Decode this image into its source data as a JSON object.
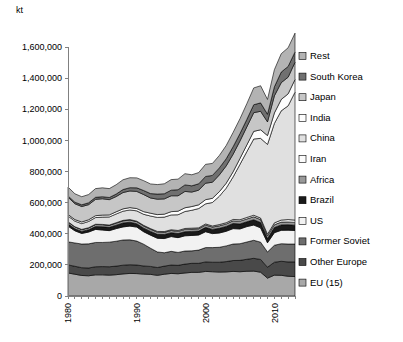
{
  "chart_data": {
    "type": "area",
    "title": "",
    "subtitle": "",
    "unit_label": "kt",
    "xlabel": "",
    "ylabel": "kt",
    "grid": false,
    "legend_position": "right",
    "stacked": true,
    "xlim": [
      1980,
      2013
    ],
    "ylim": [
      0,
      1600000
    ],
    "yticks": [
      0,
      200000,
      400000,
      600000,
      800000,
      1000000,
      1200000,
      1400000,
      1600000
    ],
    "ytick_labels": [
      "0",
      "200,000",
      "400,000",
      "600,000",
      "800,000",
      "1,000,000",
      "1,200,000",
      "1,400,000",
      "1,600,000"
    ],
    "xticks": [
      1980,
      1990,
      2000,
      2010
    ],
    "xtick_labels": [
      "1980",
      "1990",
      "2000",
      "2010"
    ],
    "x": [
      1980,
      1981,
      1982,
      1983,
      1984,
      1985,
      1986,
      1987,
      1988,
      1989,
      1990,
      1991,
      1992,
      1993,
      1994,
      1995,
      1996,
      1997,
      1998,
      1999,
      2000,
      2001,
      2002,
      2003,
      2004,
      2005,
      2006,
      2007,
      2008,
      2009,
      2010,
      2011,
      2012,
      2013
    ],
    "series": [
      {
        "name": "EU (15)",
        "color": "#a8a8a8",
        "values": [
          148000,
          140000,
          132000,
          130000,
          136000,
          136000,
          134000,
          137000,
          142000,
          145000,
          144000,
          141000,
          139000,
          133000,
          140000,
          145000,
          143000,
          148000,
          152000,
          152000,
          158000,
          156000,
          154000,
          155000,
          158000,
          156000,
          159000,
          160000,
          153000,
          115000,
          134000,
          133000,
          127000,
          125000
        ]
      },
      {
        "name": "Other Europe",
        "color": "#494949",
        "values": [
          52000,
          51000,
          50000,
          50000,
          52000,
          53000,
          54000,
          55000,
          56000,
          56000,
          55000,
          52000,
          51000,
          50000,
          52000,
          54000,
          54000,
          57000,
          58000,
          58000,
          61000,
          61000,
          63000,
          66000,
          70000,
          73000,
          77000,
          82000,
          82000,
          70000,
          83000,
          90000,
          92000,
          94000
        ]
      },
      {
        "name": "Former Soviet",
        "color": "#6e6e6e",
        "values": [
          148000,
          150000,
          152000,
          155000,
          156000,
          155000,
          158000,
          160000,
          162000,
          160000,
          154000,
          140000,
          117000,
          100000,
          86000,
          88000,
          83000,
          84000,
          80000,
          85000,
          92000,
          94000,
          96000,
          101000,
          106000,
          107000,
          111000,
          116000,
          111000,
          98000,
          109000,
          113000,
          115000,
          115000
        ]
      },
      {
        "name": "US",
        "color": "#f2f2f2",
        "values": [
          101000,
          78000,
          68000,
          76000,
          84000,
          80000,
          74000,
          81000,
          84000,
          88000,
          90000,
          80000,
          84000,
          88000,
          91000,
          95000,
          95000,
          98000,
          99000,
          97000,
          102000,
          90000,
          92000,
          94000,
          99000,
          95000,
          99000,
          98000,
          92000,
          59000,
          81000,
          86000,
          89000,
          87000
        ]
      },
      {
        "name": "Brazil",
        "color": "#1a1a1a",
        "values": [
          15000,
          13000,
          13000,
          15000,
          18000,
          21000,
          21000,
          22000,
          25000,
          25000,
          21000,
          23000,
          24000,
          25000,
          26000,
          25000,
          26000,
          26000,
          26000,
          25000,
          28000,
          27000,
          30000,
          31000,
          33000,
          32000,
          31000,
          34000,
          34000,
          27000,
          33000,
          35000,
          35000,
          34000
        ]
      },
      {
        "name": "Africa",
        "color": "#999999",
        "values": [
          12000,
          12000,
          12000,
          12000,
          13000,
          13000,
          13000,
          13000,
          14000,
          14000,
          14000,
          14000,
          14000,
          14000,
          14000,
          14000,
          14000,
          15000,
          15000,
          15000,
          15000,
          15000,
          16000,
          16000,
          17000,
          18000,
          18000,
          19000,
          19000,
          17000,
          18000,
          18000,
          18000,
          18000
        ]
      },
      {
        "name": "Iran",
        "color": "#fbfbfb",
        "values": [
          1000,
          1000,
          1000,
          1000,
          2000,
          2000,
          2000,
          3000,
          3000,
          3000,
          3000,
          4000,
          4000,
          5000,
          5000,
          5000,
          6000,
          6000,
          6000,
          6000,
          7000,
          7000,
          8000,
          8000,
          9000,
          9000,
          10000,
          10000,
          10000,
          11000,
          12000,
          13000,
          15000,
          15000
        ]
      },
      {
        "name": "China",
        "color": "#e0e0e0",
        "values": [
          37000,
          36000,
          37000,
          40000,
          43000,
          47000,
          52000,
          56000,
          59000,
          62000,
          66000,
          71000,
          81000,
          90000,
          93000,
          95000,
          101000,
          109000,
          115000,
          124000,
          129000,
          151000,
          182000,
          222000,
          273000,
          356000,
          423000,
          490000,
          512000,
          577000,
          639000,
          702000,
          731000,
          822000
        ]
      },
      {
        "name": "India",
        "color": "#fdfdfd",
        "values": [
          10000,
          10000,
          11000,
          11000,
          12000,
          13000,
          13000,
          14000,
          15000,
          15000,
          15000,
          17000,
          18000,
          18000,
          19000,
          21000,
          23000,
          24000,
          24000,
          24000,
          27000,
          27000,
          29000,
          32000,
          33000,
          38000,
          43000,
          49000,
          55000,
          57000,
          67000,
          73000,
          77000,
          81000
        ]
      },
      {
        "name": "Japan",
        "color": "#c6c6c6",
        "values": [
          111000,
          102000,
          99000,
          97000,
          105000,
          105000,
          98000,
          98000,
          105000,
          107000,
          110000,
          110000,
          98000,
          99000,
          98000,
          102000,
          99000,
          105000,
          93000,
          94000,
          106000,
          103000,
          108000,
          111000,
          113000,
          112000,
          116000,
          120000,
          119000,
          88000,
          110000,
          108000,
          107000,
          111000
        ]
      },
      {
        "name": "South Korea",
        "color": "#707070",
        "values": [
          8000,
          10000,
          11000,
          12000,
          13000,
          13000,
          14000,
          16000,
          19000,
          21000,
          23000,
          26000,
          28000,
          33000,
          33000,
          36000,
          39000,
          42000,
          40000,
          41000,
          43000,
          44000,
          45000,
          46000,
          48000,
          48000,
          48000,
          51000,
          54000,
          49000,
          58000,
          68000,
          69000,
          66000
        ]
      },
      {
        "name": "Rest",
        "color": "#b3b3b3",
        "values": [
          57000,
          54000,
          52000,
          53000,
          56000,
          57000,
          57000,
          60000,
          63000,
          64000,
          64000,
          63000,
          62000,
          61000,
          64000,
          68000,
          68000,
          72000,
          71000,
          72000,
          78000,
          77000,
          80000,
          85000,
          92000,
          95000,
          101000,
          108000,
          110000,
          95000,
          110000,
          118000,
          120000,
          121000
        ]
      }
    ],
    "legend_order": [
      "Rest",
      "South Korea",
      "Japan",
      "India",
      "China",
      "Iran",
      "Africa",
      "Brazil",
      "US",
      "Former Soviet",
      "Other Europe",
      "EU (15)"
    ]
  }
}
